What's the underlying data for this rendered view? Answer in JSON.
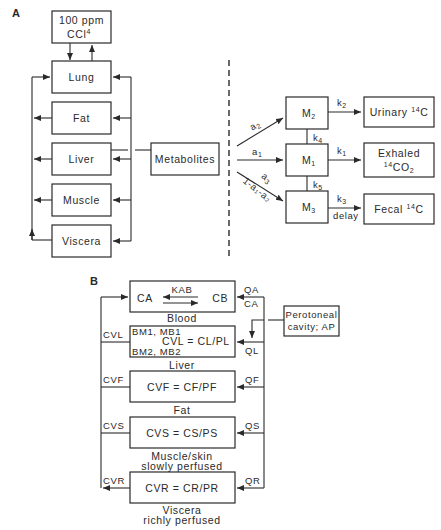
{
  "panel_a": {
    "label": "A",
    "exposure": {
      "line1": "100 ppm",
      "line2": "CCl",
      "line2_sup": "4"
    },
    "compartments": [
      "Lung",
      "Fat",
      "Liver",
      "Muscle",
      "Viscera"
    ],
    "metabolites": "Metabolites",
    "fractions": {
      "a1": "a",
      "a1_sub": "1",
      "a2": "a",
      "a2_sub": "2",
      "a3": "a",
      "a3_sub": "3",
      "a3_expr": "1-a₁-a₂"
    },
    "pools": [
      {
        "name": "M",
        "sub": "2"
      },
      {
        "name": "M",
        "sub": "1"
      },
      {
        "name": "M",
        "sub": "3"
      }
    ],
    "rates": {
      "k1": "k",
      "k1_sub": "1",
      "k2": "k",
      "k2_sub": "2",
      "k3": "k",
      "k3_sub": "3",
      "k4": "k",
      "k4_sub": "4",
      "k5": "k",
      "k5_sub": "5",
      "delay": "delay"
    },
    "outputs": {
      "urinary": "Urinary ",
      "urinary_sup": "14",
      "urinary_tail": "C",
      "exhaled_line1": "Exhaled",
      "exhaled_sup": "14",
      "exhaled_tail": "CO",
      "exhaled_sub": "2",
      "fecal": "Fecal ",
      "fecal_sup": "14",
      "fecal_tail": "C"
    }
  },
  "panel_b": {
    "label": "B",
    "blood": {
      "left": "CA",
      "right": "CB",
      "kab": "KAB",
      "caption": "Blood"
    },
    "liver": {
      "line1": "BM1, MB1",
      "line2": "CVL = CL/PL",
      "line3": "BM2, MB2",
      "caption": "Liver",
      "out_label": "CVL",
      "in_label": "QL"
    },
    "fat": {
      "eq": "CVF = CF/PF",
      "caption": "Fat",
      "out_label": "CVF",
      "in_label": "QF"
    },
    "muscle": {
      "eq": "CVS = CS/PS",
      "caption_1": "Muscle/skin",
      "caption_2": "slowly perfused",
      "out_label": "CVS",
      "in_label": "QS"
    },
    "viscera": {
      "eq": "CVR = CR/PR",
      "caption_1": "Viscera",
      "caption_2": "richly perfused",
      "out_label": "CVR",
      "in_label": "QR"
    },
    "arterial": {
      "qa": "QA",
      "ca": "CA"
    },
    "peritoneal": {
      "line1": "Perotoneal",
      "line2": "cavity; AP"
    }
  }
}
